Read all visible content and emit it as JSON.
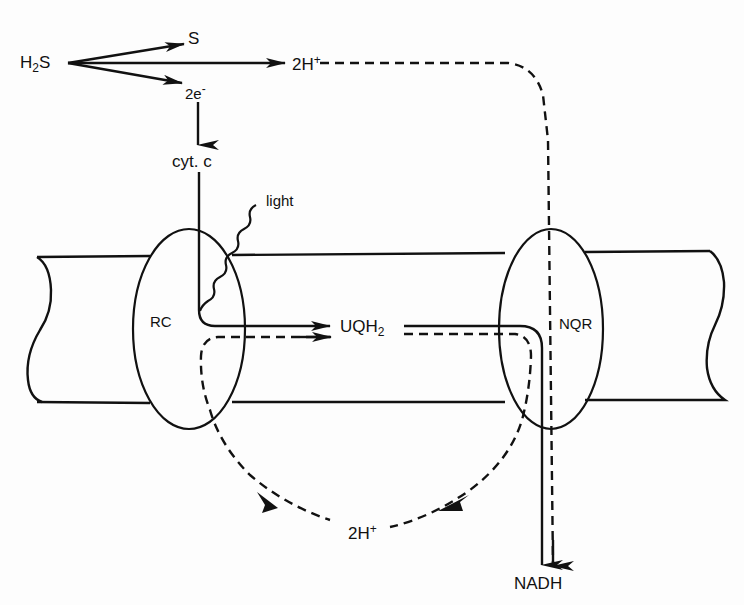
{
  "diagram": {
    "type": "membrane electron transport pathway",
    "labels": {
      "h2s_base": "H",
      "h2s_sub": "2",
      "h2s_tail": "S",
      "sulfur": "S",
      "protons_top_base": "2H",
      "protons_top_sup": "+",
      "electrons_base": "2e",
      "electrons_sup": "-",
      "cytochrome": "cyt. c",
      "light": "light",
      "reaction_center": "RC",
      "ubiquinol_base": "UQH",
      "ubiquinol_sub": "2",
      "nqr": "NQR",
      "protons_bottom_base": "2H",
      "protons_bottom_sup": "+",
      "nadh": "NADH"
    },
    "nodes": [
      {
        "id": "H2S",
        "label": "H2S"
      },
      {
        "id": "S",
        "label": "S"
      },
      {
        "id": "2H+_top",
        "label": "2H+"
      },
      {
        "id": "2e-",
        "label": "2e-"
      },
      {
        "id": "cyt_c",
        "label": "cyt. c"
      },
      {
        "id": "RC",
        "label": "RC",
        "shape": "ellipse"
      },
      {
        "id": "UQH2",
        "label": "UQH2"
      },
      {
        "id": "NQR",
        "label": "NQR",
        "shape": "ellipse"
      },
      {
        "id": "2H+_bottom",
        "label": "2H+"
      },
      {
        "id": "NADH",
        "label": "NADH"
      },
      {
        "id": "light",
        "label": "light"
      }
    ],
    "edges": [
      {
        "from": "H2S",
        "to": "S",
        "style": "solid"
      },
      {
        "from": "H2S",
        "to": "2H+_top",
        "style": "solid"
      },
      {
        "from": "H2S",
        "to": "2e-",
        "style": "solid"
      },
      {
        "from": "2e-",
        "to": "cyt_c",
        "style": "solid"
      },
      {
        "from": "cyt_c",
        "to": "UQH2",
        "via": "RC",
        "style": "solid"
      },
      {
        "from": "light",
        "to": "RC",
        "style": "wavy"
      },
      {
        "from": "RC",
        "to": "UQH2",
        "style": "dashed"
      },
      {
        "from": "UQH2",
        "to": "NADH",
        "via": "NQR",
        "style": "solid"
      },
      {
        "from": "2H+_top",
        "to": "NADH",
        "via": "NQR",
        "style": "dashed"
      },
      {
        "from": "UQH2",
        "to": "2H+_bottom",
        "via": "NQR",
        "style": "dashed"
      },
      {
        "from": "2H+_bottom",
        "to": "RC",
        "style": "dashed"
      }
    ]
  }
}
